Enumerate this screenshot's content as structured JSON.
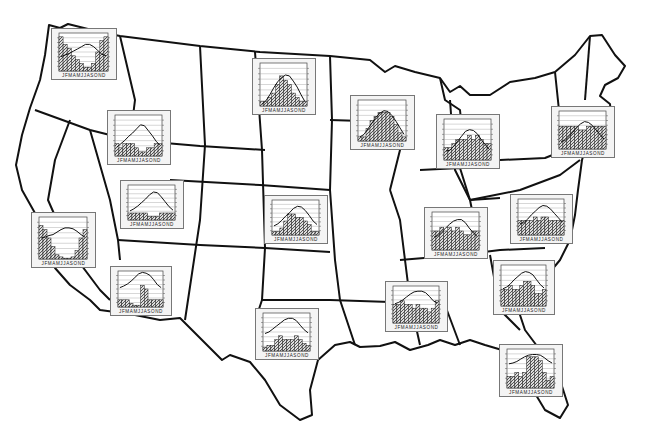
{
  "map": {
    "title": "United States climographs",
    "outline_color": "#111111",
    "background": "#ffffff"
  },
  "chart_style": {
    "line_color": "#111111",
    "bar_fill": "#555555",
    "grid_color": "#9a9a9a",
    "panel_bg": "#f4f4f4",
    "month_labels": "J F M A M J J A S O N D"
  },
  "chart_data": [
    {
      "id": "pacific-northwest",
      "type": "bar+line",
      "x": [
        "J",
        "F",
        "M",
        "A",
        "M",
        "J",
        "J",
        "A",
        "S",
        "O",
        "N",
        "D"
      ],
      "box": {
        "left": 51,
        "top": 28,
        "width": 66,
        "height": 52
      },
      "temperature": [
        4,
        6,
        8,
        11,
        14,
        17,
        20,
        20,
        17,
        12,
        7,
        5
      ],
      "precipitation": [
        9,
        7,
        6,
        4,
        3,
        2,
        1,
        1,
        2,
        5,
        8,
        9
      ]
    },
    {
      "id": "north-dakota",
      "type": "bar+line",
      "x": [
        "J",
        "F",
        "M",
        "A",
        "M",
        "J",
        "J",
        "A",
        "S",
        "O",
        "N",
        "D"
      ],
      "box": {
        "left": 252,
        "top": 58,
        "width": 64,
        "height": 57
      },
      "temperature": [
        -13,
        -9,
        -2,
        6,
        13,
        18,
        21,
        20,
        14,
        7,
        -2,
        -10
      ],
      "precipitation": [
        1,
        1,
        2,
        3,
        5,
        7,
        6,
        5,
        3,
        2,
        1,
        1
      ]
    },
    {
      "id": "idaho-montana",
      "type": "bar+line",
      "x": [
        "J",
        "F",
        "M",
        "A",
        "M",
        "J",
        "J",
        "A",
        "S",
        "O",
        "N",
        "D"
      ],
      "box": {
        "left": 107,
        "top": 110,
        "width": 64,
        "height": 55
      },
      "temperature": [
        -4,
        0,
        4,
        9,
        13,
        18,
        23,
        22,
        16,
        10,
        3,
        -2
      ],
      "precipitation": [
        3,
        2,
        3,
        3,
        3,
        2,
        1,
        1,
        2,
        2,
        3,
        3
      ]
    },
    {
      "id": "wisconsin",
      "type": "bar+line",
      "x": [
        "J",
        "F",
        "M",
        "A",
        "M",
        "J",
        "J",
        "A",
        "S",
        "O",
        "N",
        "D"
      ],
      "box": {
        "left": 350,
        "top": 95,
        "width": 65,
        "height": 55
      },
      "temperature": [
        -10,
        -7,
        0,
        7,
        14,
        19,
        22,
        21,
        16,
        9,
        1,
        -7
      ],
      "precipitation": [
        1,
        1,
        3,
        5,
        6,
        7,
        7,
        7,
        6,
        4,
        2,
        1
      ]
    },
    {
      "id": "michigan-ohio",
      "type": "bar+line",
      "x": [
        "J",
        "F",
        "M",
        "A",
        "M",
        "J",
        "J",
        "A",
        "S",
        "O",
        "N",
        "D"
      ],
      "box": {
        "left": 436,
        "top": 114,
        "width": 64,
        "height": 55
      },
      "temperature": [
        -4,
        -3,
        2,
        8,
        14,
        20,
        22,
        21,
        17,
        10,
        4,
        -2
      ],
      "precipitation": [
        3,
        3,
        4,
        5,
        5,
        5,
        6,
        5,
        6,
        5,
        4,
        4
      ]
    },
    {
      "id": "new-england",
      "type": "bar+line",
      "x": [
        "J",
        "F",
        "M",
        "A",
        "M",
        "J",
        "J",
        "A",
        "S",
        "O",
        "N",
        "D"
      ],
      "box": {
        "left": 551,
        "top": 106,
        "width": 64,
        "height": 52
      },
      "temperature": [
        -5,
        -4,
        1,
        7,
        13,
        18,
        21,
        20,
        16,
        10,
        4,
        -2
      ],
      "precipitation": [
        6,
        6,
        6,
        6,
        6,
        5,
        5,
        6,
        6,
        6,
        6,
        6
      ]
    },
    {
      "id": "utah-nevada",
      "type": "bar+line",
      "x": [
        "J",
        "F",
        "M",
        "A",
        "M",
        "J",
        "J",
        "A",
        "S",
        "O",
        "N",
        "D"
      ],
      "box": {
        "left": 120,
        "top": 180,
        "width": 64,
        "height": 49
      },
      "temperature": [
        -2,
        1,
        5,
        10,
        15,
        21,
        25,
        24,
        18,
        11,
        4,
        -1
      ],
      "precipitation": [
        2,
        2,
        2,
        2,
        2,
        1,
        1,
        1,
        2,
        2,
        2,
        2
      ]
    },
    {
      "id": "california",
      "type": "bar+line",
      "x": [
        "J",
        "F",
        "M",
        "A",
        "M",
        "J",
        "J",
        "A",
        "S",
        "O",
        "N",
        "D"
      ],
      "box": {
        "left": 31,
        "top": 212,
        "width": 65,
        "height": 56
      },
      "temperature": [
        10,
        11,
        13,
        14,
        17,
        20,
        22,
        22,
        21,
        18,
        14,
        11
      ],
      "precipitation": [
        8,
        7,
        5,
        3,
        1,
        0.5,
        0.2,
        0.2,
        0.5,
        2,
        5,
        7
      ]
    },
    {
      "id": "kansas",
      "type": "bar+line",
      "x": [
        "J",
        "F",
        "M",
        "A",
        "M",
        "J",
        "J",
        "A",
        "S",
        "O",
        "N",
        "D"
      ],
      "box": {
        "left": 264,
        "top": 195,
        "width": 64,
        "height": 49
      },
      "temperature": [
        -2,
        1,
        6,
        12,
        17,
        23,
        26,
        25,
        20,
        13,
        5,
        0
      ],
      "precipitation": [
        1,
        1,
        2,
        4,
        6,
        6,
        5,
        5,
        4,
        3,
        1,
        1
      ]
    },
    {
      "id": "kentucky-tennessee",
      "type": "bar+line",
      "x": [
        "J",
        "F",
        "M",
        "A",
        "M",
        "J",
        "J",
        "A",
        "S",
        "O",
        "N",
        "D"
      ],
      "box": {
        "left": 424,
        "top": 207,
        "width": 64,
        "height": 52
      },
      "temperature": [
        2,
        4,
        9,
        14,
        19,
        23,
        25,
        25,
        21,
        14,
        8,
        3
      ],
      "precipitation": [
        5,
        5,
        6,
        5,
        6,
        5,
        6,
        5,
        4,
        4,
        5,
        5
      ]
    },
    {
      "id": "mid-atlantic",
      "type": "bar+line",
      "x": [
        "J",
        "F",
        "M",
        "A",
        "M",
        "J",
        "J",
        "A",
        "S",
        "O",
        "N",
        "D"
      ],
      "box": {
        "left": 510,
        "top": 194,
        "width": 63,
        "height": 50
      },
      "temperature": [
        1,
        2,
        7,
        13,
        18,
        23,
        26,
        25,
        21,
        15,
        9,
        3
      ],
      "precipitation": [
        4,
        4,
        4,
        4,
        5,
        4,
        5,
        5,
        4,
        4,
        4,
        4
      ]
    },
    {
      "id": "arizona",
      "type": "bar+line",
      "x": [
        "J",
        "F",
        "M",
        "A",
        "M",
        "J",
        "J",
        "A",
        "S",
        "O",
        "N",
        "D"
      ],
      "box": {
        "left": 110,
        "top": 266,
        "width": 62,
        "height": 50
      },
      "temperature": [
        12,
        14,
        17,
        21,
        26,
        31,
        33,
        32,
        29,
        23,
        16,
        12
      ],
      "precipitation": [
        2,
        2,
        2,
        1,
        0.5,
        0.5,
        6,
        5,
        2,
        2,
        2,
        2
      ]
    },
    {
      "id": "texas",
      "type": "bar+line",
      "x": [
        "J",
        "F",
        "M",
        "A",
        "M",
        "J",
        "J",
        "A",
        "S",
        "O",
        "N",
        "D"
      ],
      "box": {
        "left": 255,
        "top": 308,
        "width": 64,
        "height": 52
      },
      "temperature": [
        8,
        10,
        14,
        18,
        22,
        26,
        28,
        28,
        25,
        19,
        13,
        9
      ],
      "precipitation": [
        1,
        1.5,
        1.5,
        3,
        4,
        3,
        3,
        3,
        4,
        3,
        2,
        1.5
      ]
    },
    {
      "id": "louisiana-mississippi",
      "type": "bar+line",
      "x": [
        "J",
        "F",
        "M",
        "A",
        "M",
        "J",
        "J",
        "A",
        "S",
        "O",
        "N",
        "D"
      ],
      "box": {
        "left": 385,
        "top": 281,
        "width": 63,
        "height": 51
      },
      "temperature": [
        11,
        13,
        16,
        20,
        24,
        27,
        28,
        28,
        26,
        21,
        15,
        12
      ],
      "precipitation": [
        5,
        5,
        6,
        5,
        5,
        4,
        5,
        4,
        4,
        3,
        4,
        6
      ]
    },
    {
      "id": "carolinas-georgia",
      "type": "bar+line",
      "x": [
        "J",
        "F",
        "M",
        "A",
        "M",
        "J",
        "J",
        "A",
        "S",
        "O",
        "N",
        "D"
      ],
      "box": {
        "left": 493,
        "top": 260,
        "width": 62,
        "height": 55
      },
      "temperature": [
        6,
        8,
        12,
        17,
        21,
        25,
        27,
        26,
        23,
        17,
        11,
        7
      ],
      "precipitation": [
        4,
        4,
        5,
        4,
        4,
        5,
        6,
        6,
        5,
        3,
        3,
        4
      ]
    },
    {
      "id": "florida",
      "type": "bar+line",
      "x": [
        "J",
        "F",
        "M",
        "A",
        "M",
        "J",
        "J",
        "A",
        "S",
        "O",
        "N",
        "D"
      ],
      "box": {
        "left": 499,
        "top": 344,
        "width": 64,
        "height": 53
      },
      "temperature": [
        16,
        17,
        19,
        22,
        25,
        27,
        28,
        28,
        27,
        24,
        20,
        17
      ],
      "precipitation": [
        3,
        3,
        4,
        3,
        4,
        8,
        8,
        8,
        7,
        4,
        2,
        3
      ]
    }
  ],
  "axes": {
    "left_axis": "temperature",
    "right_axis": "precipitation",
    "temp_range": [
      -15,
      35
    ],
    "precip_range": [
      0,
      10
    ]
  }
}
